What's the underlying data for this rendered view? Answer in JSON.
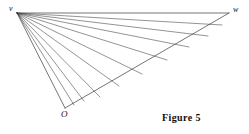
{
  "figure": {
    "caption": "Figure 5",
    "stroke_color": "#3a3a3a",
    "background_color": "#ffffff",
    "labels": {
      "apex": "v",
      "right": "w",
      "origin": "O"
    },
    "points": {
      "v": [
        17,
        13
      ],
      "w": [
        229,
        13
      ],
      "O": [
        65,
        108
      ]
    },
    "edges": [
      {
        "name": "edge-v-w",
        "from": [
          17,
          13
        ],
        "to": [
          229,
          13
        ]
      },
      {
        "name": "edge-v-O",
        "from": [
          17,
          13
        ],
        "to": [
          65,
          108
        ]
      },
      {
        "name": "edge-O-w",
        "from": [
          65,
          108
        ],
        "to": [
          229,
          13
        ]
      }
    ],
    "rays": [
      {
        "name": "ray-1",
        "from": [
          17,
          13
        ],
        "to": [
          222,
          25
        ]
      },
      {
        "name": "ray-2",
        "from": [
          17,
          13
        ],
        "to": [
          208,
          36
        ]
      },
      {
        "name": "ray-3",
        "from": [
          17,
          13
        ],
        "to": [
          189,
          47
        ]
      },
      {
        "name": "ray-4",
        "from": [
          17,
          13
        ],
        "to": [
          167,
          60
        ]
      },
      {
        "name": "ray-5",
        "from": [
          17,
          13
        ],
        "to": [
          142,
          74
        ]
      },
      {
        "name": "ray-6",
        "from": [
          17,
          13
        ],
        "to": [
          119,
          86
        ]
      },
      {
        "name": "ray-7",
        "from": [
          17,
          13
        ],
        "to": [
          100,
          97
        ]
      },
      {
        "name": "ray-8",
        "from": [
          17,
          13
        ],
        "to": [
          84,
          101
        ]
      },
      {
        "name": "ray-9",
        "from": [
          17,
          13
        ],
        "to": [
          74,
          105
        ]
      }
    ]
  }
}
